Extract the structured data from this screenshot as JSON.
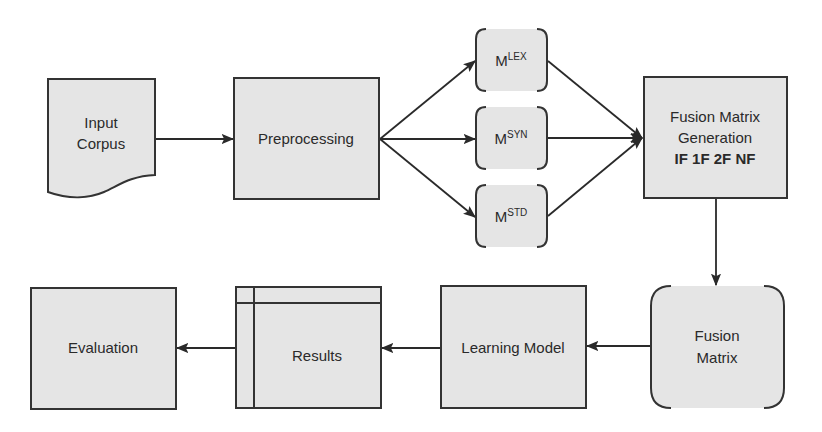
{
  "diagram": {
    "type": "flowchart",
    "colors": {
      "fill": "#e5e5e5",
      "stroke": "#333333",
      "text": "#2a2a2a",
      "background": "#ffffff"
    },
    "nodes": {
      "input_corpus": {
        "line1": "Input",
        "line2": "Corpus",
        "shape": "document"
      },
      "preprocessing": {
        "label": "Preprocessing",
        "shape": "rectangle"
      },
      "m_lex": {
        "base": "M",
        "sup": "LEX",
        "shape": "bracket-rounded"
      },
      "m_syn": {
        "base": "M",
        "sup": "SYN",
        "shape": "bracket-rounded"
      },
      "m_std": {
        "base": "M",
        "sup": "STD",
        "shape": "bracket-rounded"
      },
      "fusion_generation": {
        "line1": "Fusion Matrix",
        "line2": "Generation",
        "line3": "IF 1F 2F NF",
        "shape": "rectangle"
      },
      "fusion_matrix": {
        "line1": "Fusion",
        "line2": "Matrix",
        "shape": "bracket-rounded"
      },
      "learning_model": {
        "label": "Learning Model",
        "shape": "rectangle"
      },
      "results": {
        "label": "Results",
        "shape": "internal-storage"
      },
      "evaluation": {
        "label": "Evaluation",
        "shape": "rectangle"
      }
    },
    "edges": [
      {
        "from": "Input Corpus",
        "to": "Preprocessing"
      },
      {
        "from": "Preprocessing",
        "to": "M^LEX"
      },
      {
        "from": "Preprocessing",
        "to": "M^SYN"
      },
      {
        "from": "Preprocessing",
        "to": "M^STD"
      },
      {
        "from": "M^LEX",
        "to": "Fusion Matrix Generation"
      },
      {
        "from": "M^SYN",
        "to": "Fusion Matrix Generation"
      },
      {
        "from": "M^STD",
        "to": "Fusion Matrix Generation"
      },
      {
        "from": "Fusion Matrix Generation",
        "to": "Fusion Matrix"
      },
      {
        "from": "Fusion Matrix",
        "to": "Learning Model"
      },
      {
        "from": "Learning Model",
        "to": "Results"
      },
      {
        "from": "Results",
        "to": "Evaluation"
      }
    ]
  }
}
